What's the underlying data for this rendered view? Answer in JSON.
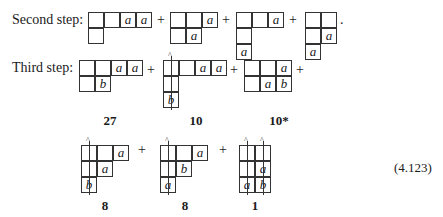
{
  "rows": [
    {
      "label": "Second step:"
    },
    {
      "label": "Third step:"
    }
  ],
  "plus": "+",
  "period": ".",
  "second_step": [
    {
      "cells": [
        [
          "",
          "",
          "a",
          "a"
        ],
        [
          ""
        ]
      ]
    },
    {
      "cells": [
        [
          "",
          "",
          "a"
        ],
        [
          "",
          "a"
        ]
      ]
    },
    {
      "cells": [
        [
          "",
          "",
          "a"
        ],
        [
          ""
        ],
        [
          "a"
        ]
      ]
    },
    {
      "cells": [
        [
          "",
          ""
        ],
        [
          "",
          "a"
        ],
        [
          "a"
        ]
      ]
    }
  ],
  "third_step": [
    {
      "cells": [
        [
          "",
          "",
          "a",
          "a"
        ],
        [
          "",
          "b"
        ]
      ],
      "multiplicity": "27"
    },
    {
      "cells": [
        [
          "",
          "",
          "a",
          "a"
        ],
        [
          ""
        ],
        [
          "b"
        ]
      ],
      "multiplicity": "10",
      "arrows": [
        0
      ]
    },
    {
      "cells": [
        [
          "",
          "",
          "a"
        ],
        [
          "",
          "a",
          "b"
        ]
      ],
      "multiplicity": "10*"
    },
    {
      "cells": [
        [
          "",
          "",
          "a"
        ],
        [
          "",
          "a"
        ],
        [
          "b"
        ]
      ],
      "multiplicity": "8",
      "arrows": [
        0
      ]
    },
    {
      "cells": [
        [
          "",
          "",
          "a"
        ],
        [
          "",
          "b"
        ],
        [
          "a"
        ]
      ],
      "multiplicity": "8",
      "arrows": [
        0
      ]
    },
    {
      "cells": [
        [
          "",
          ""
        ],
        [
          "",
          "a"
        ],
        [
          "a",
          "b"
        ]
      ],
      "multiplicity": "1",
      "arrows": [
        0,
        1
      ]
    }
  ],
  "equation_number": "(4.123)"
}
